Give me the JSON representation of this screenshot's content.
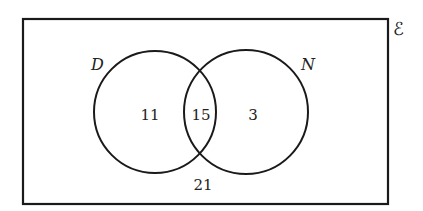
{
  "diagram": {
    "type": "venn",
    "universal_symbol": "ℰ",
    "sets": [
      {
        "name": "D",
        "only": "11"
      },
      {
        "name": "N",
        "only": "3"
      }
    ],
    "intersection": "15",
    "outside": "21"
  }
}
